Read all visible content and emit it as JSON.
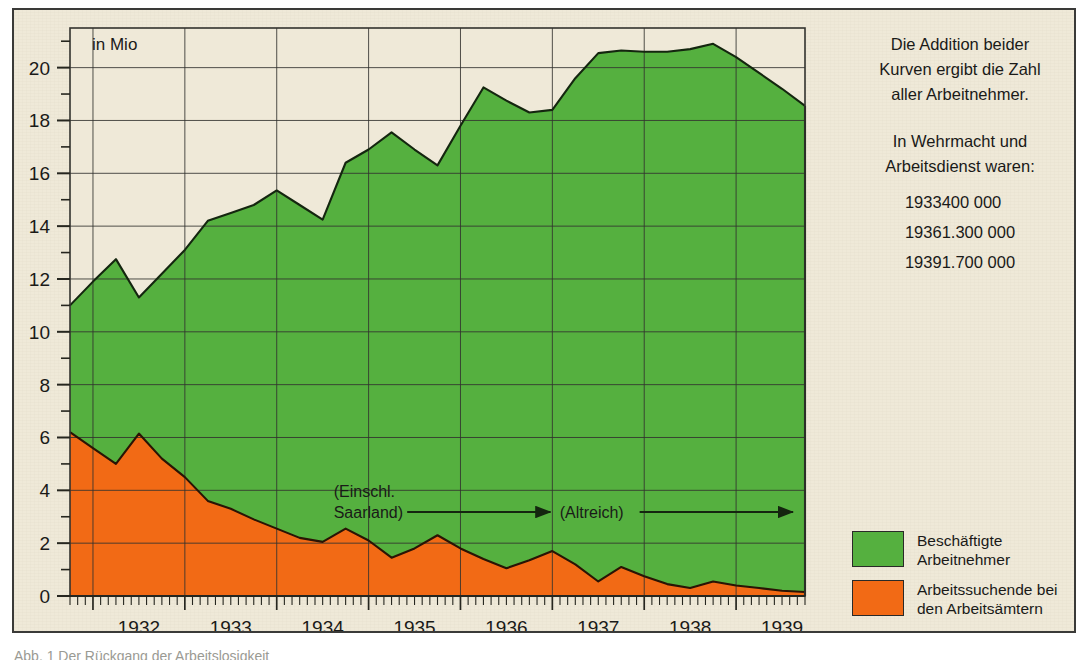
{
  "figure": {
    "unit_label": "in Mio",
    "background_color": "#efe9d8",
    "frame_color": "#3a3a38"
  },
  "side_panel": {
    "paragraph1": [
      "Die Addition beider",
      "Kurven ergibt die Zahl",
      "aller Arbeitnehmer."
    ],
    "paragraph2": [
      "In Wehrmacht und",
      "Arbeitsdienst waren:"
    ],
    "facts": [
      {
        "year": "1933",
        "value": "400 000"
      },
      {
        "year": "1936",
        "value": "1.300 000"
      },
      {
        "year": "1939",
        "value": "1.700 000"
      }
    ]
  },
  "legend": {
    "items": [
      {
        "color": "#55b03f",
        "lines": [
          "Beschäftigte",
          "Arbeitnehmer"
        ]
      },
      {
        "color": "#f26a15",
        "lines": [
          "Arbeitssuchende bei",
          "den Arbeitsämtern"
        ]
      }
    ]
  },
  "annotations": [
    {
      "name": "einschl-saarland",
      "lines": [
        "(Einschl.",
        "Saarland)"
      ]
    },
    {
      "name": "altreich",
      "lines": [
        "(Altreich)"
      ]
    }
  ],
  "bottom_caption": "Abb. 1  Der Rückgang der Arbeitslosigkeit",
  "chart_data": {
    "type": "area",
    "title": "",
    "subtitle": "",
    "xlabel": "",
    "ylabel": "in Mio",
    "ylim": [
      0,
      21.5
    ],
    "ytick_step": 2,
    "yticks": [
      0,
      2,
      4,
      6,
      8,
      10,
      12,
      14,
      16,
      18,
      20
    ],
    "yticks_minor": [
      1,
      3,
      5,
      7,
      9,
      11,
      13,
      15,
      17,
      19,
      21
    ],
    "grid": true,
    "grid_x_years": [
      "1932",
      "1933",
      "1934",
      "1935",
      "1936",
      "1937",
      "1938",
      "1939"
    ],
    "xtick_labels": [
      "1932",
      "1933",
      "1934",
      "1935",
      "1936",
      "1937",
      "1938",
      "1939"
    ],
    "x_minor_ticks": "monthly",
    "x_start": 1931.75,
    "x_end": 1939.75,
    "legend_position": "right-bottom",
    "stacked": true,
    "note": "Orange = Arbeitssuchende (bottom layer); Green = Beschäftigte stacked on top. Values read off axis at half-year / quarterly resolution.",
    "series": [
      {
        "name": "Arbeitssuchende bei den Arbeitsämtern",
        "color": "#f26a15",
        "x": [
          1931.75,
          1932.0,
          1932.25,
          1932.5,
          1932.75,
          1933.0,
          1933.25,
          1933.5,
          1933.75,
          1934.0,
          1934.25,
          1934.5,
          1934.75,
          1935.0,
          1935.25,
          1935.5,
          1935.75,
          1936.0,
          1936.25,
          1936.5,
          1936.75,
          1937.0,
          1937.25,
          1937.5,
          1937.75,
          1938.0,
          1938.25,
          1938.5,
          1938.75,
          1939.0,
          1939.25,
          1939.5,
          1939.75
        ],
        "values": [
          6.2,
          5.6,
          5.0,
          6.15,
          5.2,
          4.5,
          3.6,
          3.3,
          2.9,
          2.55,
          2.2,
          2.05,
          2.55,
          2.1,
          1.45,
          1.8,
          2.3,
          1.8,
          1.4,
          1.05,
          1.35,
          1.7,
          1.2,
          0.55,
          1.1,
          0.75,
          0.45,
          0.3,
          0.55,
          0.4,
          0.3,
          0.2,
          0.15
        ]
      },
      {
        "name": "Beschäftigte Arbeitnehmer",
        "color": "#55b03f",
        "x": [
          1931.75,
          1932.0,
          1932.25,
          1932.5,
          1932.75,
          1933.0,
          1933.25,
          1933.5,
          1933.75,
          1934.0,
          1934.25,
          1934.5,
          1934.75,
          1935.0,
          1935.25,
          1935.5,
          1935.75,
          1936.0,
          1936.25,
          1936.5,
          1936.75,
          1937.0,
          1937.25,
          1937.5,
          1937.75,
          1938.0,
          1938.25,
          1938.5,
          1938.75,
          1939.0,
          1939.25,
          1939.5,
          1939.75
        ],
        "values": [
          11.0,
          11.9,
          12.75,
          11.3,
          12.2,
          13.1,
          14.2,
          14.5,
          14.8,
          15.35,
          14.8,
          14.25,
          16.4,
          16.9,
          17.55,
          16.9,
          16.3,
          17.8,
          19.25,
          18.75,
          18.3,
          18.4,
          19.6,
          20.55,
          20.65,
          20.6,
          20.6,
          20.7,
          20.9,
          20.4,
          19.8,
          19.2,
          18.55
        ]
      }
    ]
  }
}
